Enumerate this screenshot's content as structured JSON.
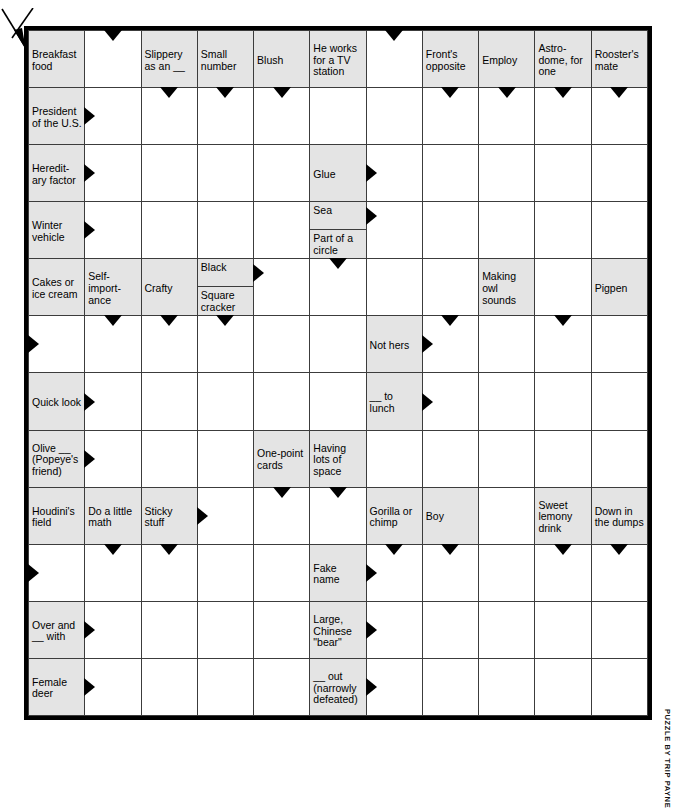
{
  "puzzle": {
    "type": "arrowword",
    "byline": "PUZZLE BY TRIP PAYNE",
    "columns": 11,
    "rows": 12,
    "clue_fill": "#e4e4e4",
    "border_color": "#000000",
    "grid_line_color": "#3c3c3c",
    "clues": {
      "breakfast_food": "Breakfast food",
      "slippery_as_an": "Slippery as an __",
      "small_number": "Small number",
      "blush": "Blush",
      "he_works_tv": "He works for a TV station",
      "fronts_opposite": "Front's opposite",
      "employ": "Employ",
      "astrodome": "Astro-dome, for one",
      "roosters_mate": "Rooster's mate",
      "president": "President of the U.S.",
      "hereditary": "Heredit-ary factor",
      "glue": "Glue",
      "winter_vehicle": "Winter vehicle",
      "sea": "Sea",
      "part_of_circle": "Part of a circle",
      "cakes_or_ice_cream": "Cakes or ice cream",
      "self_importance": "Self-import-ance",
      "crafty": "Crafty",
      "black": "Black",
      "square_cracker": "Square cracker",
      "making_owl_sounds": "Making owl sounds",
      "pigpen": "Pigpen",
      "not_hers": "Not hers",
      "quick_look": "Quick look",
      "to_lunch": "__ to lunch",
      "olive": "Olive __ (Popeye's friend)",
      "one_point_cards": "One-point cards",
      "having_lots_of_space": "Having lots of space",
      "houdinis_field": "Houdini's field",
      "do_a_little_math": "Do a little math",
      "sticky_stuff": "Sticky stuff",
      "gorilla_or_chimp": "Gorilla or chimp",
      "boy": "Boy",
      "sweet_lemony_drink": "Sweet lemony drink",
      "down_in_the_dumps": "Down in the dumps",
      "fake_name": "Fake name",
      "over_and_with": "Over and __ with",
      "large_chinese_bear": "Large, Chinese \"bear\"",
      "out_narrowly_defeated": "__ out (narrowly defeated)",
      "female_deer": "Female deer"
    }
  }
}
